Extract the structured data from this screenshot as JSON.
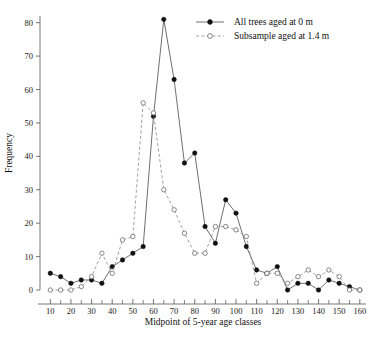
{
  "chart_data": {
    "type": "line",
    "title": "",
    "xlabel": "Midpoint of 5-year age classes",
    "ylabel": "Frequency",
    "xlim": [
      5,
      163
    ],
    "ylim": [
      0,
      82
    ],
    "grid": false,
    "legend_position": "top-right",
    "x": [
      10,
      15,
      20,
      25,
      30,
      35,
      40,
      45,
      50,
      55,
      60,
      65,
      70,
      75,
      80,
      85,
      90,
      95,
      100,
      105,
      110,
      115,
      120,
      125,
      130,
      135,
      140,
      145,
      150,
      155,
      160
    ],
    "xticks": [
      10,
      20,
      30,
      40,
      50,
      60,
      70,
      80,
      90,
      100,
      110,
      120,
      130,
      140,
      150,
      160
    ],
    "xticklabels": [
      "10",
      "20",
      "30",
      "40",
      "50",
      "60",
      "70",
      "80",
      "90",
      "100",
      "110",
      "120",
      "130",
      "140",
      "150",
      "160"
    ],
    "xticks_minor": [
      15,
      25,
      35,
      45,
      55,
      65,
      75,
      85,
      95,
      105,
      115,
      125,
      135,
      145,
      155
    ],
    "yticks": [
      0,
      10,
      20,
      30,
      40,
      50,
      60,
      70,
      80
    ],
    "yticklabels": [
      "0",
      "10",
      "20",
      "30",
      "40",
      "50",
      "60",
      "70",
      "80"
    ],
    "series": [
      {
        "name": "All trees aged at 0 m",
        "marker": "filled-circle",
        "linestyle": "solid",
        "color": "#111111",
        "values": [
          5,
          4,
          2,
          3,
          3,
          2,
          7,
          9,
          11,
          13,
          52,
          81,
          63,
          38,
          41,
          19,
          14,
          27,
          23,
          13,
          6,
          5,
          7,
          0,
          2,
          2,
          0,
          3,
          2,
          1,
          0
        ]
      },
      {
        "name": "Subsample aged at 1.4 m",
        "marker": "open-circle",
        "linestyle": "dashed",
        "color": "#6b6b6b",
        "values": [
          0,
          0,
          0,
          1,
          4,
          11,
          5,
          15,
          16,
          56,
          53,
          30,
          24,
          17,
          11,
          11,
          19,
          19,
          18,
          16,
          2,
          5,
          5,
          2,
          4,
          6,
          4,
          6,
          4,
          0,
          0
        ]
      }
    ],
    "legend": [
      {
        "label": "All trees aged at 0 m",
        "marker": "filled-circle",
        "linestyle": "solid"
      },
      {
        "label": "Subsample aged at 1.4 m",
        "marker": "open-circle",
        "linestyle": "dashed"
      }
    ]
  }
}
